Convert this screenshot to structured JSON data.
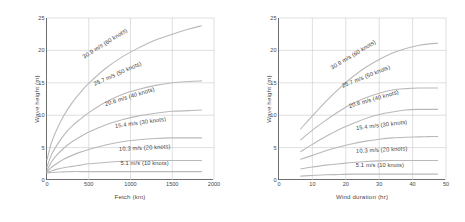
{
  "figure": {
    "background": "#ffffff",
    "curve_color": "#b9b9b9",
    "grid_color": "#c9c9c9",
    "axis_color": "#6e6e6e",
    "text_color": "#4a4a4a"
  },
  "chart_data": [
    {
      "type": "line",
      "panel": "left",
      "title": "",
      "xlabel": "Fetch  (km)",
      "ylabel": "Wave height  (m)",
      "xlim": [
        0,
        2000
      ],
      "ylim": [
        0,
        25
      ],
      "xticks": [
        0,
        500,
        1000,
        1500,
        2000
      ],
      "xtick_labels": [
        "0",
        "500",
        "1000",
        "1500",
        "2000"
      ],
      "yticks": [
        0,
        5,
        10,
        15,
        20,
        25
      ],
      "ytick_labels": [
        "0",
        "5",
        "10",
        "15",
        "20",
        "25"
      ],
      "grid": true,
      "legend": "inline-curve-labels",
      "series": [
        {
          "name": "30.9 m/s (60 knots)",
          "label": "30.9 m/s (60 knots)",
          "label_rotation": -32,
          "x": [
            0,
            50,
            100,
            200,
            300,
            400,
            500,
            700,
            900,
            1100,
            1300,
            1500,
            1700,
            1850
          ],
          "y": [
            3.1,
            5.6,
            7.3,
            9.9,
            11.9,
            13.5,
            14.9,
            17.2,
            19.0,
            20.4,
            21.6,
            22.5,
            23.3,
            23.8
          ]
        },
        {
          "name": "25.7 m/s (50 knots)",
          "label": "25.7 m/s (50 knots)",
          "label_rotation": -24,
          "x": [
            0,
            50,
            100,
            200,
            300,
            400,
            500,
            700,
            900,
            1100,
            1300,
            1500,
            1700,
            1850
          ],
          "y": [
            2.0,
            3.8,
            5.0,
            6.9,
            8.3,
            9.4,
            10.4,
            12.0,
            13.2,
            14.0,
            14.6,
            15.0,
            15.2,
            15.3
          ]
        },
        {
          "name": "20.6 m/s (40 knots)",
          "label": "20.6 m/s (40 knots)",
          "label_rotation": -17,
          "x": [
            0,
            50,
            100,
            200,
            300,
            400,
            500,
            700,
            900,
            1100,
            1300,
            1500,
            1700,
            1850
          ],
          "y": [
            1.5,
            2.7,
            3.6,
            4.9,
            5.9,
            6.7,
            7.4,
            8.5,
            9.3,
            9.9,
            10.3,
            10.6,
            10.7,
            10.8
          ]
        },
        {
          "name": "15.4 m/s (30 knots)",
          "label": "15.4 m/s (30 knots)",
          "label_rotation": -8,
          "x": [
            0,
            50,
            100,
            200,
            300,
            400,
            500,
            700,
            900,
            1100,
            1300,
            1500,
            1700,
            1850
          ],
          "y": [
            1.3,
            1.9,
            2.4,
            3.2,
            3.8,
            4.3,
            4.7,
            5.4,
            5.9,
            6.2,
            6.4,
            6.5,
            6.5,
            6.5
          ]
        },
        {
          "name": "10.3 m/s (20 knots)",
          "label": "10.3 m/s (20 knots)",
          "label_rotation": -3,
          "x": [
            0,
            50,
            100,
            200,
            300,
            400,
            500,
            700,
            900,
            1100,
            1300,
            1500,
            1700,
            1850
          ],
          "y": [
            1.2,
            1.4,
            1.6,
            1.9,
            2.1,
            2.3,
            2.5,
            2.7,
            2.9,
            2.95,
            3.0,
            3.0,
            3.0,
            3.0
          ]
        },
        {
          "name": "5.1 m/s (10 knots)",
          "label": "5.1 m/s (10 knots)",
          "label_rotation": 0,
          "x": [
            0,
            50,
            100,
            200,
            300,
            400,
            500,
            700,
            900,
            1100,
            1300,
            1500,
            1700,
            1850
          ],
          "y": [
            1.1,
            1.15,
            1.2,
            1.25,
            1.3,
            1.3,
            1.3,
            1.3,
            1.3,
            1.3,
            1.3,
            1.3,
            1.3,
            1.3
          ]
        }
      ]
    },
    {
      "type": "line",
      "panel": "right",
      "title": "",
      "xlabel": "Wind duration  (hr)",
      "ylabel": "Wave height  (m)",
      "xlim": [
        0,
        50
      ],
      "ylim": [
        0,
        25
      ],
      "xticks": [
        0,
        10,
        20,
        30,
        40,
        50
      ],
      "xtick_labels": [
        "0",
        "10",
        "20",
        "30",
        "40",
        "50"
      ],
      "yticks": [
        0,
        5,
        10,
        15,
        20,
        25
      ],
      "ytick_labels": [
        "0",
        "5",
        "10",
        "15",
        "20",
        "25"
      ],
      "grid": true,
      "legend": "inline-curve-labels",
      "series": [
        {
          "name": "30.9 m/s (60 knots)",
          "label": "30.9 m/s (60 knots)",
          "label_rotation": -31,
          "x": [
            6.5,
            10,
            14,
            18,
            22,
            26,
            30,
            34,
            38,
            42,
            45,
            47.5
          ],
          "y": [
            7.9,
            9.9,
            12.1,
            14.1,
            15.9,
            17.4,
            18.6,
            19.6,
            20.3,
            20.8,
            21.0,
            21.1
          ]
        },
        {
          "name": "25.7 m/s (50 knots)",
          "label": "25.7 m/s (50 knots)",
          "label_rotation": -22,
          "x": [
            6.5,
            10,
            14,
            18,
            22,
            26,
            30,
            34,
            38,
            42,
            45,
            47.5
          ],
          "y": [
            6.2,
            7.7,
            9.2,
            10.6,
            11.8,
            12.7,
            13.4,
            13.9,
            14.1,
            14.2,
            14.2,
            14.2
          ]
        },
        {
          "name": "20.6 m/s (40 knots)",
          "label": "20.6 m/s (40 knots)",
          "label_rotation": -16,
          "x": [
            6.5,
            10,
            14,
            18,
            22,
            26,
            30,
            34,
            38,
            42,
            45,
            47.5
          ],
          "y": [
            4.4,
            5.5,
            6.7,
            7.8,
            8.7,
            9.5,
            10.1,
            10.5,
            10.8,
            10.9,
            10.9,
            10.9
          ]
        },
        {
          "name": "15.4 m/s (30 knots)",
          "label": "15.4 m/s (30 knots)",
          "label_rotation": -7,
          "x": [
            6.5,
            10,
            14,
            18,
            22,
            26,
            30,
            34,
            38,
            42,
            45,
            47.5
          ],
          "y": [
            3.2,
            3.8,
            4.5,
            5.1,
            5.6,
            6.0,
            6.3,
            6.5,
            6.6,
            6.65,
            6.7,
            6.7
          ]
        },
        {
          "name": "10.3 m/s (20 knots)",
          "label": "10.3 m/s (20 knots)",
          "label_rotation": -3,
          "x": [
            6.5,
            10,
            14,
            18,
            22,
            26,
            30,
            34,
            38,
            42,
            45,
            47.5
          ],
          "y": [
            1.7,
            2.0,
            2.3,
            2.5,
            2.7,
            2.85,
            2.95,
            3.0,
            3.0,
            3.0,
            3.0,
            3.0
          ]
        },
        {
          "name": "5.1 m/s (10 knots)",
          "label": "5.1 m/s (10 knots)",
          "label_rotation": 0,
          "x": [
            6.5,
            10,
            14,
            18,
            22,
            26,
            30,
            34,
            38,
            42,
            45,
            47.5
          ],
          "y": [
            0.6,
            0.7,
            0.8,
            0.85,
            0.9,
            0.9,
            0.9,
            0.9,
            0.9,
            0.9,
            0.9,
            0.9
          ]
        }
      ]
    }
  ]
}
